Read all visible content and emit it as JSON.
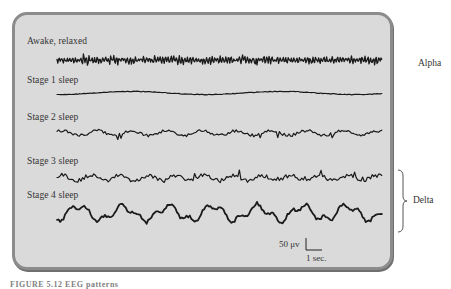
{
  "figure": {
    "type": "eeg-sleep-stages",
    "stages": [
      {
        "label": "Awake, relaxed",
        "label_xy": [
          27,
          36
        ],
        "baseline": 60,
        "amplitude": 3.2,
        "freq": 2.3,
        "style": "noisy"
      },
      {
        "label": "Stage 1 sleep",
        "label_xy": [
          27,
          75
        ],
        "baseline": 93,
        "amplitude": 1.6,
        "freq": 0.35,
        "style": "smooth"
      },
      {
        "label": "Stage 2 sleep",
        "label_xy": [
          27,
          112
        ],
        "baseline": 133,
        "amplitude": 4.0,
        "freq": 0.7,
        "style": "spindle"
      },
      {
        "label": "Stage 3 sleep",
        "label_xy": [
          27,
          156
        ],
        "baseline": 178,
        "amplitude": 5.5,
        "freq": 0.8,
        "style": "slow"
      },
      {
        "label": "Stage 4 sleep",
        "label_xy": [
          27,
          190
        ],
        "baseline": 213,
        "amplitude": 9.5,
        "freq": 0.55,
        "style": "delta"
      }
    ],
    "trace_x_start": 57,
    "trace_x_end": 382,
    "groups": [
      {
        "label": "Alpha",
        "xy": [
          418,
          58
        ]
      },
      {
        "label": "Delta",
        "xy": [
          413,
          195
        ],
        "brace": {
          "x": 398,
          "y1": 170,
          "y2": 232
        }
      }
    ],
    "scale_bar": {
      "voltage_label": "50 μv",
      "time_label": "1 sec.",
      "voltage_xy": [
        279,
        239
      ],
      "time_xy": [
        306,
        253
      ]
    },
    "caption": "FIGURE 5.12  EEG patterns"
  },
  "colors": {
    "panel_bg": "#dadada",
    "panel_border": "#8c8c8c",
    "trace": "#1a1a1a"
  }
}
